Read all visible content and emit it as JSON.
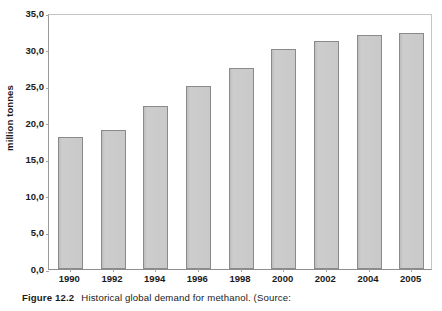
{
  "chart_data": {
    "type": "bar",
    "title": "",
    "xlabel": "",
    "ylabel": "million tonnes",
    "categories": [
      "1990",
      "1992",
      "1994",
      "1996",
      "1998",
      "2000",
      "2002",
      "2004",
      "2005"
    ],
    "values": [
      18.0,
      19.0,
      22.3,
      25.0,
      27.5,
      30.1,
      31.2,
      32.0,
      32.3
    ],
    "ylim": [
      0.0,
      35.0
    ],
    "ytick_values": [
      0.0,
      5.0,
      10.0,
      15.0,
      20.0,
      25.0,
      30.0,
      35.0
    ],
    "ytick_labels": [
      "0,0",
      "5,0",
      "10,0",
      "15,0",
      "20,0",
      "25,0",
      "30,0",
      "35,0"
    ],
    "grid": false,
    "legend": false,
    "legend_position": "none",
    "bar_fill_color": "#c9c9c9",
    "bar_border_color": "#8a8a8a",
    "plot_border_color": "#b9b9b9",
    "background_color": "#ffffff"
  },
  "caption": {
    "number": "Figure 12.2",
    "text": "Historical global demand for methanol. (Source:"
  }
}
